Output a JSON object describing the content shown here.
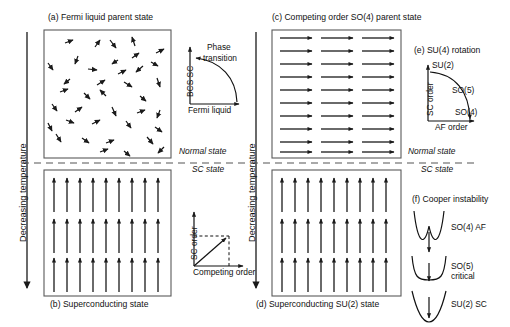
{
  "figure": {
    "type": "schematic-diagram",
    "background": "#ffffff",
    "stroke": "#1a1a1a",
    "width": 510,
    "height": 327
  },
  "axes": {
    "left_temperature_label": "Decreasing temperature",
    "right_temperature_label": "Decreasing temperature"
  },
  "dividers": {
    "left": {
      "above_label": "Normal state",
      "below_label": "SC state"
    },
    "right": {
      "above_label": "Normal state",
      "below_label": "SC state"
    }
  },
  "panels": {
    "a": {
      "key": "(a)",
      "title": "(a) Fermi liquid parent state",
      "content": "randomly oriented arrows",
      "arrow_count": 38,
      "arrow_orientation": "random"
    },
    "b": {
      "key": "(b)",
      "title": "(b) Superconducting state",
      "content": "aligned up arrows",
      "rows": 3,
      "cols": 10,
      "arrow_orientation": "up"
    },
    "c": {
      "key": "(c)",
      "title": "(c) Competing order SO(4) parent state",
      "content": "aligned right arrows",
      "rows": 10,
      "cols": 3,
      "arrow_orientation": "right"
    },
    "d": {
      "key": "(d)",
      "title": "(d) Superconducting SU(2) state",
      "content": "aligned up arrows",
      "rows": 3,
      "cols": 10,
      "arrow_orientation": "up"
    },
    "e": {
      "key": "(e)",
      "title": "(e) SU(4) rotation",
      "xlabel": "AF order",
      "ylabel": "SC order",
      "annotations": [
        "SU(2)",
        "SO(5)",
        "SO(4)"
      ],
      "curve": "quarter-circle arc from y-axis to x-axis, arrow pointing clockwise"
    },
    "f": {
      "key": "(f)",
      "title": "(f) Cooper instability",
      "potentials": [
        {
          "label": "SO(4) AF",
          "shape": "double-well"
        },
        {
          "label_line1": "SO(5)",
          "label_line2": "critical",
          "shape": "flat-bottom-well"
        },
        {
          "label": "SU(2) SC",
          "shape": "single-V-well"
        }
      ],
      "flow_arrows": 3
    }
  },
  "inset_a": {
    "title": "Phase transition",
    "xlabel": "Fermi liquid",
    "ylabel": "BCS SC",
    "curve": "quarter-circle arc with arrow toward y-axis"
  },
  "inset_b": {
    "xlabel": "Competing order",
    "ylabel": "SC order",
    "curve": "diagonal arrow from origin with dashed projection lines"
  }
}
